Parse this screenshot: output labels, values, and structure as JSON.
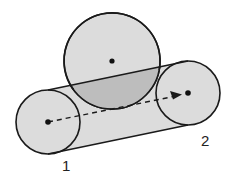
{
  "diagram": {
    "labels": {
      "point1": "1",
      "point2": "2"
    },
    "colors": {
      "fill_light": "#dcdcdc",
      "fill_intersection": "#bdbdbd",
      "stroke": "#1a1a1a"
    },
    "shapes": {
      "obstacle_circle": {
        "cx": 112,
        "cy": 61,
        "r": 48
      },
      "circle_1": {
        "cx": 48,
        "cy": 122,
        "r": 32
      },
      "circle_2": {
        "cx": 188,
        "cy": 93,
        "r": 32
      }
    }
  }
}
